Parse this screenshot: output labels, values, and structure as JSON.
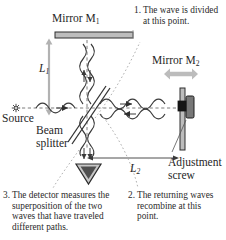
{
  "figure": {
    "type": "optics-ray-diagram"
  },
  "labels": {
    "mirror1": "Mirror M",
    "mirror1_sub": "1",
    "mirror2": "Mirror M",
    "mirror2_sub": "2",
    "source": "Source",
    "beamsplitter_line1": "Beam",
    "beamsplitter_line2": "splitter",
    "adjust_line1": "Adjustment",
    "adjust_line2": "screw",
    "length1": "L",
    "length1_sub": "1",
    "length2": "L",
    "length2_sub": "2"
  },
  "captions": [
    {
      "id": "caption-1",
      "number": "1.",
      "text": "The wave is divided at this point."
    },
    {
      "id": "caption-2",
      "number": "2.",
      "text": "The returning waves recombine at this point."
    },
    {
      "id": "caption-3",
      "number": "3.",
      "text": "The detector measures the superposition of the two waves that have traveled different paths."
    }
  ],
  "components": [
    {
      "name": "light-source",
      "icon": "starburst-icon"
    },
    {
      "name": "beam-splitter",
      "icon": "diagonal-plate-icon"
    },
    {
      "name": "mirror-m1",
      "icon": "horizontal-mirror-bar-icon"
    },
    {
      "name": "mirror-m2",
      "icon": "vertical-mirror-bar-icon"
    },
    {
      "name": "adjustment-screw",
      "icon": "knob-icon"
    },
    {
      "name": "detector",
      "icon": "down-triangle-icon"
    },
    {
      "name": "mirror2-motion-arrow",
      "icon": "double-headed-arrow-icon"
    },
    {
      "name": "l1-dimension-arrow",
      "icon": "vertical-double-arrow-icon"
    },
    {
      "name": "l2-dimension-arrow",
      "icon": "horizontal-double-arrow-icon"
    }
  ],
  "colors": {
    "ink": "#2a2a2a",
    "wave": "#3b3b3b",
    "mirror_fill": "#b9b9b9",
    "mirror_stroke": "#2e2e2e",
    "arrow_gray": "#b5b5b5",
    "dashed_axis": "#6e6e6e",
    "leader_dotted": "#a0a0a0",
    "knob_dark": "#1d1d1d",
    "background": "#ffffff"
  }
}
